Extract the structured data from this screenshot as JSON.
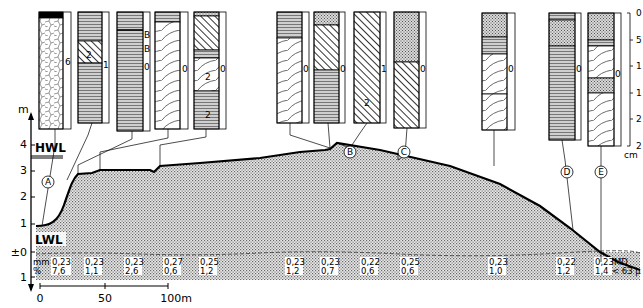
{
  "figure": {
    "y_axis": {
      "unit": "m",
      "ticks": [
        {
          "label": "4",
          "value": 4
        },
        {
          "label": "3",
          "value": 3
        },
        {
          "label": "2",
          "value": 2
        },
        {
          "label": "1",
          "value": 1
        },
        {
          "label": "±0",
          "value": 0
        },
        {
          "label": "1",
          "value": -1
        }
      ]
    },
    "water_levels": {
      "high": "HWL",
      "low": "LWL"
    },
    "x_scale": {
      "labels": [
        "0",
        "50",
        "100m"
      ]
    },
    "sample_labels": [
      "A",
      "B",
      "C",
      "D",
      "E"
    ],
    "row_headers": {
      "median": "mm",
      "silt": "%",
      "md_label": "MD",
      "fines_label": "< 63 µ"
    },
    "grain_data": [
      {
        "md": "0,23",
        "pct": "7,6"
      },
      {
        "md": "0,23",
        "pct": "1,1"
      },
      {
        "md": "0,23",
        "pct": "2,6"
      },
      {
        "md": "0,27",
        "pct": "0,6"
      },
      {
        "md": "0,25",
        "pct": "1,2"
      },
      {
        "md": "0,23",
        "pct": "1,2"
      },
      {
        "md": "0,23",
        "pct": "0,7"
      },
      {
        "md": "0,22",
        "pct": "0,6"
      },
      {
        "md": "0,25",
        "pct": "0,6"
      },
      {
        "md": "0,23",
        "pct": "1,0"
      },
      {
        "md": "0,22",
        "pct": "1,2"
      },
      {
        "md": "0,23",
        "pct": "1,4"
      }
    ],
    "core_side_labels": [
      "6",
      "1",
      "B",
      "B",
      "0",
      "0",
      "0",
      "0",
      "0",
      "1",
      "0",
      "0",
      "0",
      "0",
      "0"
    ],
    "core_inner_labels": [
      "2",
      "2",
      "2",
      "2"
    ],
    "core_scale": {
      "unit": "cm",
      "ticks": [
        "0",
        "5",
        "1",
        "1",
        "2",
        "2"
      ]
    }
  }
}
